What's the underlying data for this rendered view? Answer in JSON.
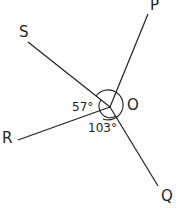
{
  "diagram": {
    "center_label": "O",
    "points": {
      "P": "P",
      "Q": "Q",
      "R": "R",
      "S": "S"
    },
    "angles": {
      "SOR": "57°",
      "ROQ": "103°"
    },
    "line_color": "#231f20"
  }
}
